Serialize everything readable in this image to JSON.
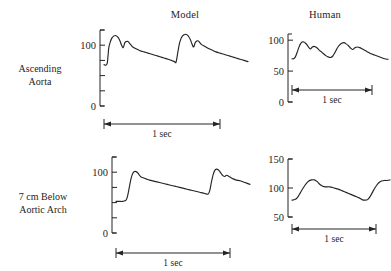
{
  "figure": {
    "background_color": "#ffffff",
    "trace_color": "#242424",
    "axis_color": "#242424"
  },
  "columns": {
    "model_label": "Model",
    "human_label": "Human"
  },
  "rows": {
    "ascending_aorta_line1": "Ascending",
    "ascending_aorta_line2": "Aorta",
    "below_arch_line1": "7 cm Below",
    "below_arch_line2": "Aortic Arch"
  },
  "scalebar": {
    "label": "1 sec"
  },
  "chart_data": [
    {
      "id": "model-ascending-aorta",
      "type": "line",
      "title": "Model",
      "row": "Ascending Aorta",
      "xlabel": "",
      "ylabel": "",
      "ylim": [
        0,
        125
      ],
      "yticks_labeled": [
        0,
        100
      ],
      "yticks_unlabeled": [
        25,
        50,
        75,
        125
      ],
      "ytick_labels": [
        "0",
        "100"
      ],
      "grid": false,
      "legend": false,
      "scalebar": "1 sec",
      "x": [
        0.0,
        0.02,
        0.04,
        0.05,
        0.06,
        0.08,
        0.1,
        0.12,
        0.14,
        0.16,
        0.18,
        0.2,
        0.22,
        0.24,
        0.26,
        0.28,
        0.3,
        0.32,
        0.34,
        0.36,
        0.4,
        0.45,
        0.5,
        0.55,
        0.6,
        0.65,
        0.7,
        0.75,
        0.8,
        0.84,
        0.86,
        0.88,
        0.9,
        0.92,
        0.94,
        0.96,
        0.98,
        1.0,
        1.02,
        1.04,
        1.06,
        1.08,
        1.1,
        1.12,
        1.14,
        1.16,
        1.18,
        1.2,
        1.22,
        1.26,
        1.3,
        1.35,
        1.4,
        1.45,
        1.5,
        1.55,
        1.6,
        1.65,
        1.7,
        1.75,
        1.8
      ],
      "y": [
        68,
        67,
        70,
        82,
        96,
        106,
        112,
        115,
        116,
        115,
        112,
        107,
        100,
        96,
        104,
        106,
        106,
        103,
        100,
        97,
        94,
        91,
        89,
        87,
        85,
        83,
        81,
        79,
        77,
        75,
        74,
        73,
        72,
        86,
        101,
        110,
        115,
        117,
        118,
        117,
        114,
        109,
        102,
        97,
        104,
        107,
        107,
        104,
        101,
        98,
        95,
        92,
        89,
        87,
        85,
        83,
        81,
        79,
        77,
        75,
        73
      ]
    },
    {
      "id": "human-ascending-aorta",
      "type": "line",
      "title": "Human",
      "row": "Ascending Aorta",
      "xlabel": "",
      "ylabel": "",
      "ylim": [
        0,
        110
      ],
      "yticks_labeled": [
        0,
        50,
        100
      ],
      "ytick_labels": [
        "0",
        "50",
        "100"
      ],
      "grid": false,
      "legend": false,
      "scalebar": "1 sec",
      "x": [
        0.0,
        0.03,
        0.06,
        0.09,
        0.12,
        0.15,
        0.18,
        0.21,
        0.24,
        0.27,
        0.3,
        0.33,
        0.36,
        0.39,
        0.42,
        0.45,
        0.48,
        0.52,
        0.56,
        0.6,
        0.64,
        0.68,
        0.72,
        0.76,
        0.8,
        0.84,
        0.88,
        0.92,
        0.96,
        1.0,
        1.04,
        1.08,
        1.12,
        1.16,
        1.2,
        1.24,
        1.28,
        1.32,
        1.36,
        1.4,
        1.46,
        1.52,
        1.58,
        1.64,
        1.7
      ],
      "y": [
        70,
        70,
        73,
        80,
        88,
        94,
        97,
        97,
        95,
        92,
        88,
        86,
        89,
        90,
        89,
        87,
        84,
        81,
        78,
        75,
        73,
        72,
        74,
        80,
        87,
        92,
        95,
        96,
        94,
        91,
        87,
        85,
        88,
        89,
        88,
        86,
        84,
        82,
        80,
        78,
        76,
        74,
        72,
        70,
        69
      ]
    },
    {
      "id": "model-7cm-below-aortic-arch",
      "type": "line",
      "title": "Model",
      "row": "7 cm Below Aortic Arch",
      "xlabel": "",
      "ylabel": "",
      "ylim": [
        0,
        125
      ],
      "yticks_labeled": [
        0,
        100
      ],
      "yticks_unlabeled": [
        25,
        50,
        75,
        125
      ],
      "ytick_labels": [
        "0",
        "100"
      ],
      "grid": false,
      "legend": false,
      "scalebar": "1 sec",
      "x": [
        0.0,
        0.04,
        0.08,
        0.12,
        0.14,
        0.16,
        0.18,
        0.2,
        0.22,
        0.24,
        0.26,
        0.28,
        0.3,
        0.32,
        0.34,
        0.36,
        0.4,
        0.46,
        0.52,
        0.58,
        0.64,
        0.7,
        0.76,
        0.82,
        0.88,
        0.94,
        1.0,
        1.06,
        1.1,
        1.12,
        1.14,
        1.16,
        1.18,
        1.2,
        1.22,
        1.24,
        1.26,
        1.28,
        1.3,
        1.32,
        1.36,
        1.4,
        1.44,
        1.48,
        1.52,
        1.56,
        1.6
      ],
      "y": [
        52,
        52,
        52,
        54,
        62,
        76,
        90,
        98,
        101,
        101,
        99,
        95,
        92,
        91,
        90,
        89,
        87,
        85,
        83,
        81,
        79,
        77,
        75,
        73,
        71,
        69,
        67,
        65,
        64,
        70,
        84,
        96,
        103,
        105,
        104,
        101,
        97,
        94,
        93,
        95,
        92,
        89,
        87,
        86,
        84,
        82,
        80
      ]
    },
    {
      "id": "human-7cm-below-aortic-arch",
      "type": "line",
      "title": "Human",
      "row": "7 cm Below Aortic Arch",
      "xlabel": "",
      "ylabel": "",
      "ylim": [
        50,
        150
      ],
      "yticks_labeled": [
        50,
        100,
        150
      ],
      "ytick_labels": [
        "50",
        "100",
        "150"
      ],
      "grid": false,
      "legend": false,
      "scalebar": "1 sec",
      "x": [
        0.0,
        0.04,
        0.08,
        0.12,
        0.16,
        0.2,
        0.24,
        0.28,
        0.32,
        0.36,
        0.4,
        0.44,
        0.48,
        0.54,
        0.6,
        0.66,
        0.72,
        0.78,
        0.84,
        0.9,
        0.96,
        1.0,
        1.04,
        1.08,
        1.12,
        1.16,
        1.2,
        1.24,
        1.28,
        1.32,
        1.36,
        1.4
      ],
      "y": [
        79,
        80,
        84,
        92,
        100,
        107,
        112,
        114,
        114,
        111,
        106,
        103,
        102,
        102,
        100,
        98,
        95,
        92,
        89,
        86,
        83,
        80,
        79,
        80,
        86,
        95,
        103,
        109,
        112,
        113,
        113,
        114
      ]
    }
  ]
}
